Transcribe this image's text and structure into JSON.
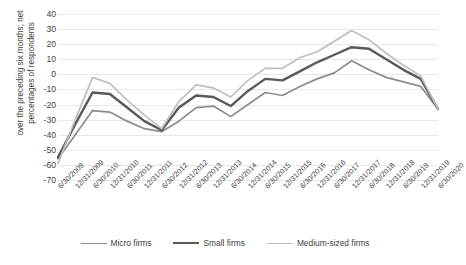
{
  "chart_data": {
    "type": "line",
    "title": "",
    "xlabel": "",
    "ylabel": "over the preceding six months; net percentages of respondents",
    "ylabel_line1": "over the preceding six months; net",
    "ylabel_line2": "percentages of respondents",
    "ylim": [
      -70,
      40
    ],
    "ytick_step": 10,
    "yticks": [
      40,
      30,
      20,
      10,
      0,
      -10,
      -20,
      -30,
      -40,
      -50,
      -60,
      -70
    ],
    "grid": true,
    "legend_position": "bottom",
    "categories": [
      "6/30/2009",
      "12/31/2009",
      "6/30/2010",
      "12/31/2010",
      "6/30/2011",
      "12/31/2011",
      "6/30/2012",
      "12/31/2012",
      "6/30/2013",
      "12/31/2013",
      "6/30/2014",
      "12/31/2014",
      "6/30/2015",
      "12/31/2015",
      "6/30/2016",
      "12/31/2016",
      "6/30/2017",
      "12/31/2017",
      "6/30/2018",
      "12/31/2018",
      "6/30/2019",
      "12/31/2019",
      "6/30/2020"
    ],
    "series": [
      {
        "name": "Micro firms",
        "color": "#8c8c8c",
        "width": 1.7,
        "values": [
          -56,
          -40,
          -24,
          -25,
          -31,
          -36,
          -38,
          -31,
          -22,
          -21,
          -28,
          -20,
          -12,
          -14,
          -8,
          -3,
          1,
          9,
          3,
          -2,
          -5,
          -8,
          -23
        ]
      },
      {
        "name": "Small firms",
        "color": "#595959",
        "width": 2.4,
        "values": [
          -55,
          -33,
          -12,
          -13,
          -22,
          -31,
          -37,
          -22,
          -14,
          -15,
          -21,
          -11,
          -3,
          -4,
          2,
          8,
          13,
          18,
          17,
          10,
          3,
          -3,
          -23
        ]
      },
      {
        "name": "Medium-sized firms",
        "color": "#bfbfbf",
        "width": 1.7,
        "values": [
          -59,
          -30,
          -2,
          -6,
          -17,
          -27,
          -36,
          -18,
          -7,
          -9,
          -15,
          -4,
          4,
          4,
          11,
          15,
          22,
          29,
          23,
          14,
          6,
          -1,
          -23
        ]
      }
    ]
  },
  "legend": {
    "items": [
      {
        "label": "Micro firms",
        "color": "#8c8c8c"
      },
      {
        "label": "Small firms",
        "color": "#595959"
      },
      {
        "label": "Medium-sized firms",
        "color": "#bfbfbf"
      }
    ]
  }
}
